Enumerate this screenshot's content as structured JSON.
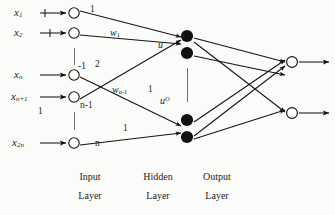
{
  "diagram": {
    "colors": {
      "stroke": "#1a1a1a",
      "background": "#fbfbfa",
      "hidden_node_fill": "#111111",
      "open_node_fill": "#ffffff"
    }
  },
  "inputs": [
    {
      "id": "x1",
      "label_base": "x",
      "label_sub": "1",
      "y": 13
    },
    {
      "id": "x2",
      "label_base": "x",
      "label_sub": "2",
      "y": 33
    },
    {
      "id": "xn",
      "label_base": "x",
      "label_sub": "n",
      "y": 75
    },
    {
      "id": "xn1",
      "label_base": "x",
      "label_sub": "n+1",
      "y": 97
    },
    {
      "id": "x2n",
      "label_base": "x",
      "label_sub": "2n",
      "y": 143
    }
  ],
  "input_node_indices": [
    "1",
    "2",
    "n-1",
    "n"
  ],
  "edge_labels": {
    "top_one": "1",
    "w_first_base": "w",
    "w_first_sub": "1",
    "minus_one": "-1",
    "two": "2",
    "w_last_base": "w",
    "w_last_sub": "n-1",
    "n_minus_one": "n-1",
    "mid_one": "1",
    "left_one": "1",
    "lower_one": "1",
    "n": "n"
  },
  "u_labels": {
    "upper_base": "u",
    "lower_base": "u",
    "lower_sup": "O"
  },
  "layers": [
    {
      "id": "input",
      "line1": "Input",
      "line2": "Layer",
      "x": 88
    },
    {
      "id": "hidden",
      "line1": "Hidden",
      "line2": "Layer",
      "x": 155
    },
    {
      "id": "output",
      "line1": "Output",
      "line2": "Layer",
      "x": 215
    }
  ]
}
